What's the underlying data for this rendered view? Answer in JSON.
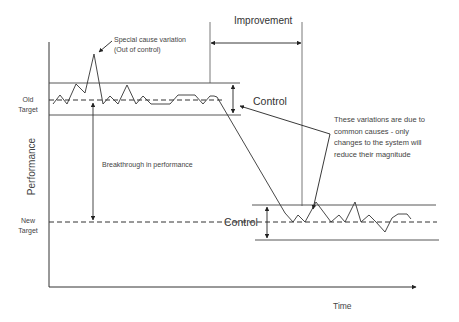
{
  "diagram": {
    "title": "",
    "axes": {
      "y_label": "Performance",
      "x_label": "Time"
    },
    "targets": {
      "old": {
        "line1": "Old",
        "line2": "Target"
      },
      "new": {
        "line1": "New",
        "line2": "Target"
      }
    },
    "annotations": {
      "special_cause_line1": "Special cause variation",
      "special_cause_line2": "(Out of control)",
      "improvement": "Improvement",
      "control_old": "Control",
      "control_new": "Control",
      "breakthrough": "Breakthrough in performance",
      "common_causes_lines": [
        "These variations are due to",
        "common causes - only",
        "changes to the system will",
        "reduce their magnitude"
      ]
    },
    "colors": {
      "line": "#333333",
      "text": "#444444",
      "background": "#ffffff"
    }
  }
}
